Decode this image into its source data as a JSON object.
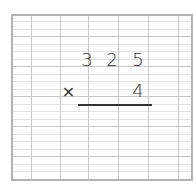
{
  "worksheet": {
    "type": "grid-multiplication",
    "colors": {
      "border": "#b3b3b3",
      "grid_light": "#e2e2e2",
      "grid_dark": "#c6c6c6",
      "ink": "#2a2a2a"
    },
    "problem": {
      "multiplicand_digits": [
        "3",
        "2",
        "5"
      ],
      "operator": "×",
      "multiplier_digits": [
        "4"
      ]
    }
  }
}
